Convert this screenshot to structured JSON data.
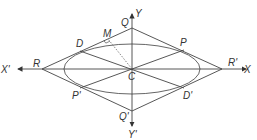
{
  "diagram": {
    "colors": {
      "line": "#555555",
      "text": "#333333",
      "background": "#ffffff"
    },
    "center": {
      "label": "C",
      "x": 132,
      "y": 69
    },
    "ellipse": {
      "cx": 132,
      "cy": 69,
      "rx": 68,
      "ry": 25
    },
    "axes": {
      "x_pos": {
        "label": "X",
        "x": 249,
        "y": 69
      },
      "x_neg": {
        "label": "X'",
        "x": 14,
        "y": 69
      },
      "y_pos": {
        "label": "Y",
        "x": 132,
        "y": 12
      },
      "y_neg": {
        "label": "Y'",
        "x": 132,
        "y": 128
      }
    },
    "points": {
      "Q": {
        "label": "Q",
        "x": 132,
        "y": 28
      },
      "Q_prime": {
        "label": "Q'",
        "x": 132,
        "y": 111
      },
      "R": {
        "label": "R",
        "x": 42,
        "y": 69
      },
      "R_prime": {
        "label": "R'",
        "x": 222,
        "y": 69
      },
      "D": {
        "label": "D",
        "x": 80,
        "y": 51
      },
      "P": {
        "label": "P",
        "x": 184,
        "y": 50
      },
      "P_prime": {
        "label": "P'",
        "x": 80,
        "y": 88
      },
      "D_prime": {
        "label": "D'",
        "x": 184,
        "y": 88
      },
      "M": {
        "label": "M",
        "x": 108,
        "y": 39
      }
    },
    "labels": {
      "X": "X",
      "X_prime": "X'",
      "Y": "Y",
      "Y_prime": "Y'",
      "C": "C",
      "Q": "Q",
      "Q_prime": "Q'",
      "R": "R",
      "R_prime": "R'",
      "D": "D",
      "P": "P",
      "P_prime": "P'",
      "D_prime": "D'",
      "M": "M"
    }
  }
}
